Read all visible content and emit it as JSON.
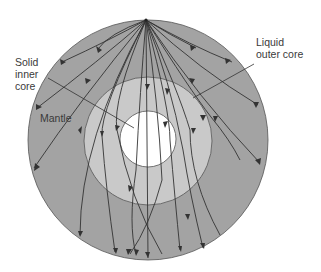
{
  "diagram": {
    "labels": {
      "inner_core": "Solid\ninner\ncore",
      "outer_core": "Liquid\nouter core",
      "mantle": "Mantle"
    },
    "colors": {
      "mantle": "#a3a3a3",
      "outer_core": "#c9c9c9",
      "inner_core": "#ffffff",
      "rays": "#333333",
      "background": "#ffffff"
    },
    "layers": [
      {
        "name": "mantle",
        "cx": 148,
        "cy": 140,
        "r": 120
      },
      {
        "name": "outer_core",
        "cx": 148,
        "cy": 141,
        "r": 64
      },
      {
        "name": "inner_core",
        "cx": 148,
        "cy": 139,
        "r": 28
      }
    ],
    "source_point": {
      "x": 146,
      "y": 20
    },
    "ray_count": 18
  }
}
